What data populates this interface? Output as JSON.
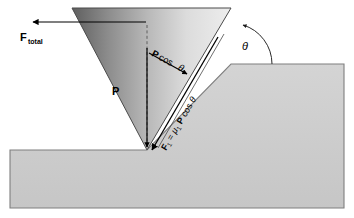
{
  "diagram": {
    "background_color": "#ffffff",
    "labels": {
      "f_total": {
        "symbol": "F",
        "subscript": "total",
        "full": "F total"
      },
      "p_cos_theta": {
        "full": "P cos θ",
        "bold_part": "P",
        "rest": " cos ",
        "theta": "θ"
      },
      "p_vertical": {
        "full": "P"
      },
      "friction": {
        "full": "F₁ = μ₁ P cos θ",
        "f_symbol": "F",
        "f_sub": "1",
        "equals": " = ",
        "mu": "μ",
        "mu_sub": "1",
        "p": " P",
        "cos": " cos ",
        "theta": "θ"
      },
      "theta_angle": {
        "full": "θ"
      }
    },
    "colors": {
      "wedge_dark": "#6e6e6e",
      "wedge_light": "#e8e8e8",
      "block_fill": "#cdcdcd",
      "block_stroke": "#7a7a7a",
      "outline": "#3a3a3a",
      "arrow": "#000000",
      "dashed": "#4a4a4a"
    },
    "geometry": {
      "wedge_apex": {
        "x": 147,
        "y": 150
      },
      "wedge_top_left": {
        "x": 72,
        "y": 8
      },
      "wedge_top_right": {
        "x": 231,
        "y": 8
      },
      "block_right_top_y": 64,
      "block_left_top_y": 150,
      "block_left_x": 10,
      "block_right_x": 344,
      "block_bottom_y": 208
    }
  }
}
